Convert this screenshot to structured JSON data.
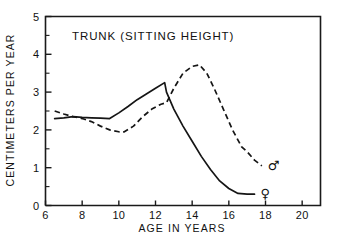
{
  "chart_data": {
    "type": "line",
    "title": "TRUNK (SITTING HEIGHT)",
    "xlabel": "AGE IN YEARS",
    "ylabel": "CENTIMETERS PER YEAR",
    "xlim": [
      6,
      21
    ],
    "ylim": [
      0,
      5
    ],
    "xticks": [
      6,
      8,
      10,
      12,
      14,
      16,
      18,
      20
    ],
    "xticklabels": [
      "6",
      "8",
      "10",
      "12",
      "14",
      "16",
      "18",
      "20"
    ],
    "yticks": [
      0,
      1,
      2,
      3,
      4,
      5
    ],
    "yticklabels": [
      "0",
      "1",
      "2",
      "3",
      "4",
      "5"
    ],
    "yticks_minor": [
      0.5,
      1.5,
      2.5,
      3.5,
      4.5
    ],
    "grid": false,
    "legend_position": "inline-right-endpoint",
    "series": [
      {
        "name": "female",
        "symbol": "♀",
        "style": "solid",
        "x": [
          6.5,
          7.0,
          7.5,
          8.0,
          8.5,
          9.0,
          9.5,
          10.0,
          10.5,
          11.0,
          11.5,
          12.0,
          12.5,
          12.6,
          13.0,
          13.5,
          14.0,
          14.5,
          15.0,
          15.5,
          16.0,
          16.5,
          17.0,
          17.4
        ],
        "y": [
          2.3,
          2.32,
          2.35,
          2.33,
          2.32,
          2.31,
          2.3,
          2.45,
          2.62,
          2.8,
          2.95,
          3.1,
          3.25,
          3.0,
          2.55,
          2.1,
          1.7,
          1.3,
          0.95,
          0.65,
          0.45,
          0.32,
          0.3,
          0.3
        ]
      },
      {
        "name": "male",
        "symbol": "♂",
        "style": "dashed",
        "x": [
          6.5,
          7.0,
          7.5,
          8.0,
          8.5,
          9.0,
          9.5,
          10.0,
          10.3,
          10.8,
          11.3,
          11.8,
          12.3,
          12.6,
          13.0,
          13.5,
          14.0,
          14.4,
          14.8,
          15.2,
          15.7,
          16.2,
          16.7,
          17.0,
          17.4,
          17.8
        ],
        "y": [
          2.5,
          2.42,
          2.35,
          2.3,
          2.22,
          2.1,
          2.0,
          1.95,
          1.95,
          2.1,
          2.35,
          2.55,
          2.68,
          2.72,
          3.1,
          3.5,
          3.68,
          3.72,
          3.5,
          3.1,
          2.55,
          2.0,
          1.55,
          1.42,
          1.2,
          1.05
        ]
      }
    ]
  }
}
